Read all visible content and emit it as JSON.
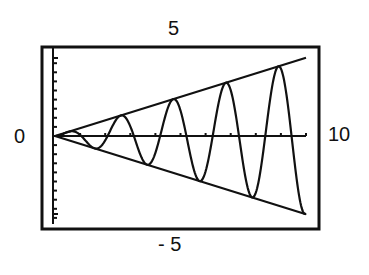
{
  "labels": {
    "ymax": "5",
    "ymin": "- 5",
    "xmin": "0",
    "xmax": "10"
  },
  "chart_data": {
    "type": "line",
    "title": "",
    "xlabel": "",
    "ylabel": "",
    "xlim": [
      0,
      10
    ],
    "ylim": [
      -5,
      5
    ],
    "x_tick_step": 1,
    "y_tick_step": 0.5,
    "grid": false,
    "series": [
      {
        "name": "upper envelope",
        "expression": "y = 0.43x",
        "x": [
          0,
          10
        ],
        "y": [
          0,
          4.3
        ]
      },
      {
        "name": "lower envelope",
        "expression": "y = -0.43x",
        "x": [
          0,
          10
        ],
        "y": [
          0,
          -4.3
        ]
      },
      {
        "name": "oscillating curve",
        "expression": "y = 0.43x*sin(3x)",
        "amplitude_factor": 0.43,
        "frequency": 3.0,
        "samples": 400
      }
    ],
    "colors": {
      "stroke": "#111111",
      "background": "#ffffff"
    }
  }
}
